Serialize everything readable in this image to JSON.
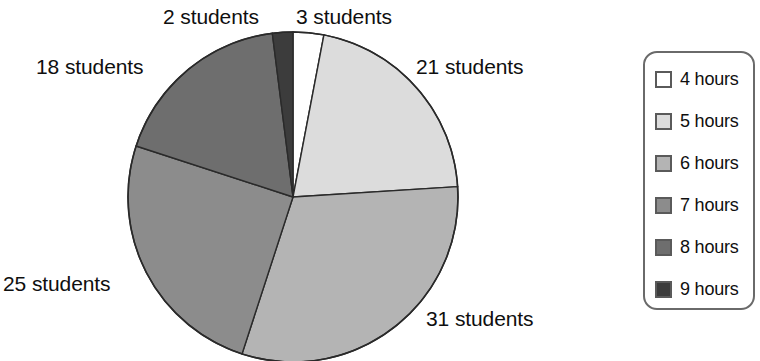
{
  "chart_data": {
    "type": "pie",
    "title": "",
    "subtitle": "",
    "xlabel": "",
    "ylabel": "",
    "unit": "students",
    "legend_position": "right",
    "grid": false,
    "total": 100,
    "categories": [
      "4 hours",
      "5 hours",
      "6 hours",
      "7 hours",
      "8 hours",
      "9 hours"
    ],
    "values": [
      3,
      21,
      31,
      25,
      18,
      2
    ],
    "data_labels": [
      "3 students",
      "21 students",
      "31 students",
      "25 students",
      "18 students",
      "2 students"
    ],
    "slice_colors": [
      "#ffffff",
      "#dcdcdc",
      "#b4b4b4",
      "#8c8c8c",
      "#6e6e6e",
      "#3c3c3c"
    ],
    "slice_order_clockwise_from_top": [
      "4 hours",
      "5 hours",
      "6 hours",
      "7 hours",
      "8 hours",
      "9 hours"
    ],
    "slices": [
      {
        "label": "4 hours",
        "value": 3,
        "data_label": "3 students",
        "color": "#ffffff",
        "start_deg": 0.0,
        "end_deg": 10.8
      },
      {
        "label": "5 hours",
        "value": 21,
        "data_label": "21 students",
        "color": "#dcdcdc",
        "start_deg": 10.8,
        "end_deg": 86.4
      },
      {
        "label": "6 hours",
        "value": 31,
        "data_label": "31 students",
        "color": "#b4b4b4",
        "start_deg": 86.4,
        "end_deg": 198.0
      },
      {
        "label": "7 hours",
        "value": 25,
        "data_label": "25 students",
        "color": "#8c8c8c",
        "start_deg": 198.0,
        "end_deg": 288.0
      },
      {
        "label": "8 hours",
        "value": 18,
        "data_label": "18 students",
        "color": "#6e6e6e",
        "start_deg": 288.0,
        "end_deg": 352.8
      },
      {
        "label": "9 hours",
        "value": 2,
        "data_label": "2 students",
        "color": "#3c3c3c",
        "start_deg": 352.8,
        "end_deg": 360.0
      }
    ],
    "outline_color": "#2a2a2a"
  },
  "labels": {
    "students_2": "2 students",
    "students_3": "3 students",
    "students_18": "18 students",
    "students_21": "21 students",
    "students_25": "25 students",
    "students_31": "31 students"
  },
  "legend": {
    "border_color": "#6a6a6a",
    "items": [
      {
        "label": "4 hours",
        "color": "#ffffff"
      },
      {
        "label": "5 hours",
        "color": "#dcdcdc"
      },
      {
        "label": "6 hours",
        "color": "#b4b4b4"
      },
      {
        "label": "7 hours",
        "color": "#8c8c8c"
      },
      {
        "label": "8 hours",
        "color": "#6e6e6e"
      },
      {
        "label": "9 hours",
        "color": "#3c3c3c"
      }
    ]
  }
}
